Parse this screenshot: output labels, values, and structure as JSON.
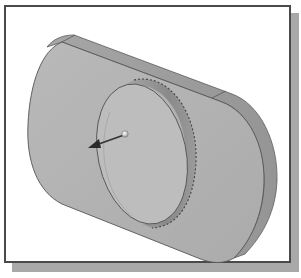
{
  "figure": {
    "colors": {
      "background": "#ffffff",
      "frame_border": "#4a4a4a",
      "frame_shadow": "#a9a9a9",
      "plate_face": "#b3b3b3",
      "plate_edge": "#9c9c9c",
      "boss_face": "#bcbcbc",
      "boss_side": "#8f8f8f",
      "outline": "#555555",
      "arrow": "#333333",
      "arrow_ball": "#f2f2f2"
    },
    "elements": [
      {
        "name": "slot-plate",
        "label": "Plate body"
      },
      {
        "name": "cylinder-boss",
        "label": "Cylindrical boss"
      },
      {
        "name": "direction-arrow",
        "label": "Extrude direction arrow"
      }
    ]
  }
}
